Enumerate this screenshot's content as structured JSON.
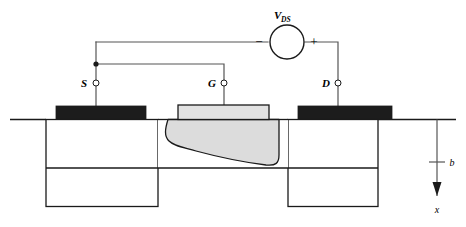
{
  "figure": {
    "colors": {
      "line": "#1a1a1a",
      "wire": "#555555",
      "contact_metal": "#1c1c1c",
      "gate_metal": "#e2e2e2",
      "depletion_fill": "#dcdcdc",
      "background": "#ffffff"
    },
    "terminals": [
      {
        "id": "source",
        "label": "S",
        "x": 96,
        "y": 86
      },
      {
        "id": "gate",
        "label": "G",
        "x": 224,
        "y": 86
      },
      {
        "id": "drain",
        "label": "D",
        "x": 338,
        "y": 86
      }
    ],
    "source_supply": {
      "label": "V",
      "subscript": "DS",
      "minus_sign": "−",
      "plus_sign": "+",
      "cx": 287,
      "cy": 42,
      "r": 17
    },
    "axis": {
      "depth_label": "b",
      "direction_label": "x",
      "tick_y": 162,
      "x": 437
    },
    "regions": [
      {
        "id": "source-mesa",
        "name": "source region"
      },
      {
        "id": "gate-channel",
        "name": "channel under gate"
      },
      {
        "id": "drain-mesa",
        "name": "drain region"
      },
      {
        "id": "depletion",
        "name": "depletion region"
      }
    ]
  }
}
